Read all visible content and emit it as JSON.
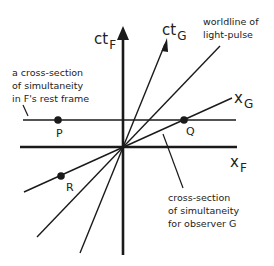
{
  "diagram": {
    "colors": {
      "line": "#1a1a1a",
      "background": "#ffffff"
    },
    "axes": {
      "ct_F": {
        "main": "ct",
        "sub": "F"
      },
      "ct_G": {
        "main": "ct",
        "sub": "G"
      },
      "x_F": {
        "main": "x",
        "sub": "F"
      },
      "x_G": {
        "main": "x",
        "sub": "G"
      }
    },
    "points": [
      {
        "id": "P",
        "label": "P"
      },
      {
        "id": "Q",
        "label": "Q"
      },
      {
        "id": "R",
        "label": "R"
      }
    ],
    "annotations": {
      "rest_frame": [
        "a cross-section",
        "of simultaneity",
        "in F's rest frame"
      ],
      "light_pulse": [
        "worldline of",
        "light-pulse"
      ],
      "observer_g": [
        "cross-section",
        "of simultaneity",
        "for observer G"
      ]
    }
  }
}
